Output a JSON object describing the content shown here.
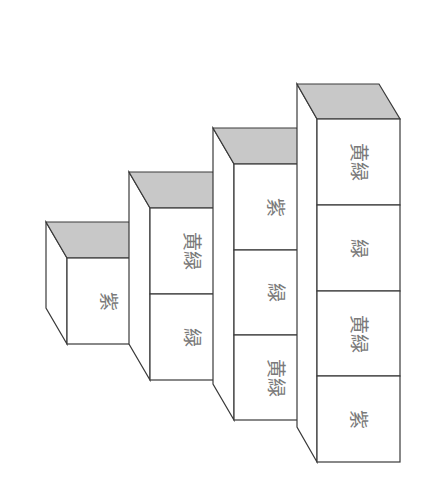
{
  "diagram": {
    "title": "",
    "colors": {
      "background": "#ffffff",
      "stroke": "#3a3a3a",
      "top_face": "#c8c8c8",
      "label": "#7a7a7a"
    },
    "columns": [
      {
        "id": "column-1",
        "cubes": [
          {
            "label": "紫"
          }
        ]
      },
      {
        "id": "column-2",
        "cubes": [
          {
            "label": "黄緑"
          },
          {
            "label": "緑"
          }
        ]
      },
      {
        "id": "column-3",
        "cubes": [
          {
            "label": "紫"
          },
          {
            "label": "緑"
          },
          {
            "label": "黄緑"
          }
        ]
      },
      {
        "id": "column-4",
        "cubes": [
          {
            "label": "黄緑"
          },
          {
            "label": "緑"
          },
          {
            "label": "黄緑"
          },
          {
            "label": "紫"
          }
        ]
      }
    ]
  }
}
